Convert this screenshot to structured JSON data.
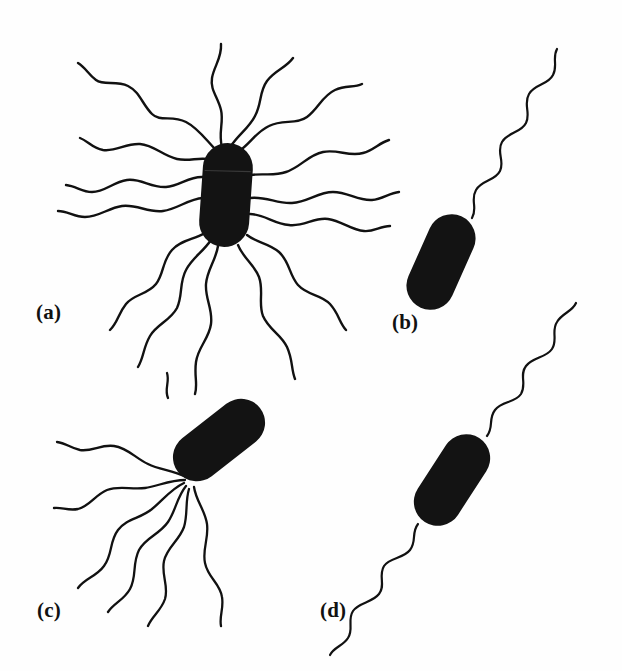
{
  "figure": {
    "background_color": "#fefefe",
    "ink_color": "#131313",
    "width": 622,
    "height": 671,
    "style": "black-and-white line drawing"
  },
  "panels": [
    {
      "id": "a",
      "label": "(a)",
      "arrangement": "peritrichous",
      "description": "Rod-shaped cell with many flagella distributed over the entire surface",
      "flagella_count": 14,
      "cell": {
        "shape": "rod",
        "center_x": 226,
        "center_y": 195,
        "length": 104,
        "width": 50,
        "rotation_deg": 4
      }
    },
    {
      "id": "b",
      "label": "(b)",
      "arrangement": "monotrichous",
      "description": "Rod-shaped cell with a single flagellum at one pole",
      "flagella_count": 1,
      "cell": {
        "shape": "rod",
        "center_x": 441,
        "center_y": 262,
        "length": 100,
        "width": 48,
        "rotation_deg": 24
      }
    },
    {
      "id": "c",
      "label": "(c)",
      "arrangement": "lophotrichous",
      "description": "Rod-shaped cell with a tuft of flagella at one pole",
      "flagella_count": 6,
      "cell": {
        "shape": "rod",
        "center_x": 219,
        "center_y": 440,
        "length": 104,
        "width": 48,
        "rotation_deg": 52
      }
    },
    {
      "id": "d",
      "label": "(d)",
      "arrangement": "amphitrichous",
      "description": "Rod-shaped cell with one flagellum at each pole",
      "flagella_count": 2,
      "cell": {
        "shape": "rod",
        "center_x": 452,
        "center_y": 480,
        "length": 100,
        "width": 48,
        "rotation_deg": 33
      }
    }
  ],
  "labels": {
    "a": "(a)",
    "b": "(b)",
    "c": "(c)",
    "d": "(d)"
  }
}
